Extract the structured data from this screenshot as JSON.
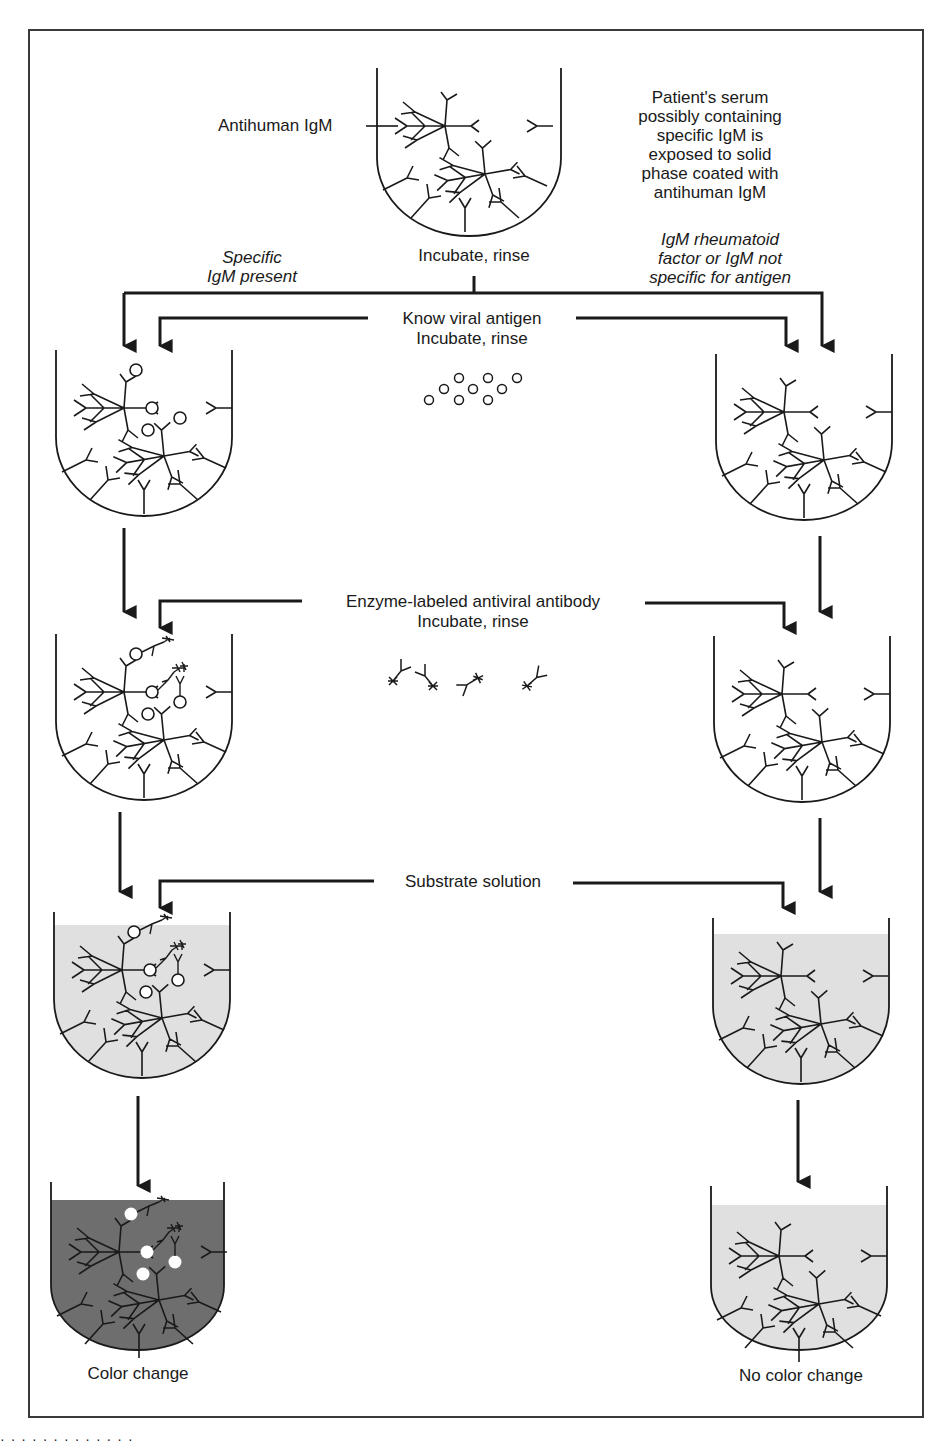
{
  "diagram": {
    "type": "IgM capture ELISA flow diagram",
    "colors": {
      "line": "#1a1a1a",
      "frame": "#3a3a3a",
      "substrate_fill": "#e0e0e0",
      "color_change_fill": "#6e6e6e"
    },
    "top": {
      "well_label": "Antihuman IgM",
      "description": "Patient's serum possibly containing specific IgM is exposed to solid phase coated with antihuman IgM",
      "description_lines": [
        "Patient's serum",
        "possibly containing",
        "specific IgM is",
        "exposed to solid",
        "phase coated with",
        "antihuman IgM"
      ],
      "step": "Incubate, rinse"
    },
    "branches": {
      "left": {
        "label_lines": [
          "Specific",
          "IgM present"
        ],
        "label": "Specific IgM present"
      },
      "right": {
        "label_lines": [
          "IgM rheumatoid",
          "factor or IgM not",
          "specific for antigen"
        ],
        "label": "IgM rheumatoid factor or IgM not specific for antigen"
      }
    },
    "steps": [
      {
        "reagent": "Know viral antigen",
        "action": "Incubate, rinse",
        "reagent_icon": "antigen-circles-icon"
      },
      {
        "reagent": "Enzyme-labeled antiviral antibody",
        "action": "Incubate, rinse",
        "reagent_icon": "labeled-antibody-icon"
      },
      {
        "reagent": "Substrate solution",
        "action": ""
      }
    ],
    "results": {
      "left": "Color change",
      "right": "No color change"
    }
  }
}
